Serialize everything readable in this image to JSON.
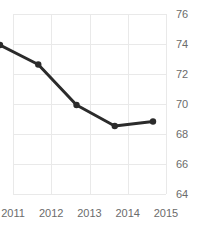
{
  "chart_data": {
    "type": "line",
    "title": "Freedom Trend",
    "xlabel": "",
    "ylabel": "",
    "categories": [
      "2011",
      "2012",
      "2013",
      "2014",
      "2015"
    ],
    "x": [
      2011,
      2012,
      2013,
      2014,
      2015
    ],
    "values": [
      73.0,
      71.7,
      69.0,
      67.6,
      67.9
    ],
    "series": [
      {
        "name": "Freedom Trend",
        "values": [
          73.0,
          71.7,
          69.0,
          67.6,
          67.9
        ]
      }
    ],
    "y_ticks": [
      76,
      74,
      72,
      70,
      68,
      66,
      64
    ],
    "y_tick_labels": [
      "76",
      "74",
      "72",
      "70",
      "68",
      "66",
      "64"
    ],
    "x_tick_labels": [
      "2011",
      "2012",
      "2013",
      "2014",
      "2015"
    ],
    "ylim": [
      64,
      76
    ],
    "xlim": [
      2011,
      2015
    ],
    "grid": true,
    "legend": false,
    "legend_position": "none",
    "line_color": "#2b2b2b",
    "marker_color": "#2b2b2b",
    "grid_color": "#e9e9e9",
    "tick_label_color": "#6b6b6b",
    "title_color": "#1a1a1a",
    "background_color": "#ffffff"
  }
}
